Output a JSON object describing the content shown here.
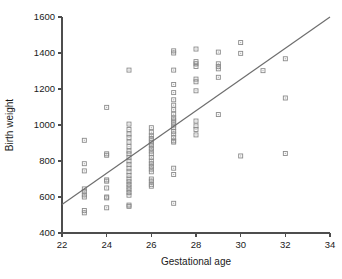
{
  "chart_data": {
    "type": "scatter",
    "title": "",
    "xlabel": "Gestational age",
    "ylabel": "Birth weight",
    "xlim": [
      22,
      34
    ],
    "ylim": [
      400,
      1600
    ],
    "xticks": [
      22,
      24,
      26,
      28,
      30,
      32,
      34
    ],
    "yticks": [
      400,
      600,
      800,
      1000,
      1200,
      1400,
      1600
    ],
    "xtick_labels": [
      "22",
      "24",
      "26",
      "28",
      "30",
      "32",
      "34"
    ],
    "ytick_labels": [
      "400",
      "600",
      "800",
      "1000",
      "1200",
      "1400",
      "1600"
    ],
    "grid": false,
    "legend": null,
    "marker": "open-square",
    "marker_color": "#8a8a8a",
    "series": [
      {
        "name": "observations",
        "points": [
          [
            23,
            915
          ],
          [
            23,
            785
          ],
          [
            23,
            745
          ],
          [
            23,
            645
          ],
          [
            23,
            630
          ],
          [
            23,
            612
          ],
          [
            23,
            600
          ],
          [
            23,
            525
          ],
          [
            23,
            512
          ],
          [
            24,
            1098
          ],
          [
            24,
            840
          ],
          [
            24,
            832
          ],
          [
            24,
            695
          ],
          [
            24,
            688
          ],
          [
            24,
            650
          ],
          [
            24,
            600
          ],
          [
            24,
            595
          ],
          [
            24,
            540
          ],
          [
            25,
            1305
          ],
          [
            25,
            1005
          ],
          [
            25,
            975
          ],
          [
            25,
            950
          ],
          [
            25,
            930
          ],
          [
            25,
            905
          ],
          [
            25,
            880
          ],
          [
            25,
            855
          ],
          [
            25,
            840
          ],
          [
            25,
            820
          ],
          [
            25,
            800
          ],
          [
            25,
            780
          ],
          [
            25,
            760
          ],
          [
            25,
            740
          ],
          [
            25,
            720
          ],
          [
            25,
            700
          ],
          [
            25,
            685
          ],
          [
            25,
            670
          ],
          [
            25,
            655
          ],
          [
            25,
            640
          ],
          [
            25,
            625
          ],
          [
            25,
            610
          ],
          [
            25,
            555
          ],
          [
            25,
            548
          ],
          [
            26,
            985
          ],
          [
            26,
            960
          ],
          [
            26,
            940
          ],
          [
            26,
            925
          ],
          [
            26,
            912
          ],
          [
            26,
            900
          ],
          [
            26,
            885
          ],
          [
            26,
            870
          ],
          [
            26,
            855
          ],
          [
            26,
            840
          ],
          [
            26,
            820
          ],
          [
            26,
            800
          ],
          [
            26,
            785
          ],
          [
            26,
            770
          ],
          [
            26,
            755
          ],
          [
            26,
            740
          ],
          [
            26,
            700
          ],
          [
            26,
            688
          ],
          [
            26,
            670
          ],
          [
            26,
            660
          ],
          [
            27,
            1412
          ],
          [
            27,
            1400
          ],
          [
            27,
            1305
          ],
          [
            27,
            1225
          ],
          [
            27,
            1180
          ],
          [
            27,
            1140
          ],
          [
            27,
            1110
          ],
          [
            27,
            1085
          ],
          [
            27,
            1060
          ],
          [
            27,
            1040
          ],
          [
            27,
            1028
          ],
          [
            27,
            1015
          ],
          [
            27,
            1000
          ],
          [
            27,
            985
          ],
          [
            27,
            965
          ],
          [
            27,
            950
          ],
          [
            27,
            930
          ],
          [
            27,
            912
          ],
          [
            27,
            905
          ],
          [
            27,
            760
          ],
          [
            27,
            725
          ],
          [
            27,
            565
          ],
          [
            28,
            1422
          ],
          [
            28,
            1352
          ],
          [
            28,
            1340
          ],
          [
            28,
            1325
          ],
          [
            28,
            1255
          ],
          [
            28,
            1240
          ],
          [
            28,
            1190
          ],
          [
            28,
            1022
          ],
          [
            28,
            995
          ],
          [
            28,
            975
          ],
          [
            28,
            945
          ],
          [
            29,
            1405
          ],
          [
            29,
            1340
          ],
          [
            29,
            1325
          ],
          [
            29,
            1312
          ],
          [
            29,
            1265
          ],
          [
            29,
            1058
          ],
          [
            30,
            1458
          ],
          [
            30,
            1398
          ],
          [
            30,
            828
          ],
          [
            31,
            1302
          ],
          [
            32,
            1368
          ],
          [
            32,
            1150
          ],
          [
            32,
            842
          ]
        ]
      }
    ],
    "fit_line": {
      "name": "regression-line",
      "color": "#6e6e6e",
      "x_start": 22,
      "y_start": 558,
      "x_end": 34,
      "y_end": 1600
    }
  },
  "axes": {
    "x_title": "Gestational age",
    "y_title": "Birth weight"
  }
}
